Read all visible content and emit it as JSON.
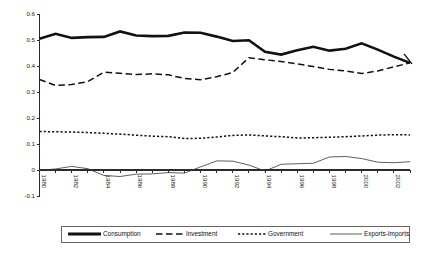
{
  "chart_data": {
    "type": "line",
    "title": "",
    "subtitle": "",
    "xlabel": "",
    "ylabel": "",
    "xlim": [
      1980,
      2003
    ],
    "ylim": [
      -0.1,
      0.6
    ],
    "grid": false,
    "legend_position": "bottom",
    "x": [
      1980,
      1981,
      1982,
      1983,
      1984,
      1985,
      1986,
      1987,
      1988,
      1989,
      1990,
      1991,
      1992,
      1993,
      1994,
      1995,
      1996,
      1997,
      1998,
      1999,
      2000,
      2001,
      2002,
      2003
    ],
    "x_tick_labels": [
      "1980",
      "1982",
      "1984",
      "1986",
      "1988",
      "1990",
      "1992",
      "1994",
      "1996",
      "1998",
      "2000",
      "2002"
    ],
    "x_ticks": [
      1980,
      1982,
      1984,
      1986,
      1988,
      1990,
      1992,
      1994,
      1996,
      1998,
      2000,
      2002
    ],
    "y_tick_labels": [
      "-0.1",
      "0",
      "0.1",
      "0.2",
      "0.3",
      "0.4",
      "0.5",
      "0.6"
    ],
    "y_ticks": [
      -0.1,
      0,
      0.1,
      0.2,
      0.3,
      0.4,
      0.5,
      0.6
    ],
    "series": [
      {
        "name": "Consumption",
        "line_style": "solid-thick",
        "values": [
          0.505,
          0.524,
          0.508,
          0.511,
          0.512,
          0.533,
          0.517,
          0.515,
          0.516,
          0.529,
          0.528,
          0.513,
          0.496,
          0.499,
          0.455,
          0.444,
          0.461,
          0.474,
          0.459,
          0.466,
          0.487,
          0.463,
          0.436,
          0.412
        ]
      },
      {
        "name": "Investment",
        "line_style": "dashed-long",
        "values": [
          0.348,
          0.325,
          0.329,
          0.34,
          0.376,
          0.372,
          0.367,
          0.37,
          0.366,
          0.352,
          0.347,
          0.359,
          0.375,
          0.432,
          0.424,
          0.417,
          0.408,
          0.398,
          0.387,
          0.381,
          0.371,
          0.381,
          0.397,
          0.412
        ]
      },
      {
        "name": "Government",
        "line_style": "dotted",
        "values": [
          0.148,
          0.147,
          0.146,
          0.144,
          0.141,
          0.138,
          0.134,
          0.13,
          0.128,
          0.121,
          0.122,
          0.127,
          0.133,
          0.135,
          0.131,
          0.128,
          0.123,
          0.124,
          0.126,
          0.128,
          0.131,
          0.134,
          0.136,
          0.135
        ]
      },
      {
        "name": "Exports-Imports",
        "line_style": "solid-thin",
        "values": [
          -0.001,
          0.004,
          0.014,
          0.005,
          -0.021,
          -0.025,
          -0.016,
          -0.015,
          -0.01,
          -0.012,
          0.012,
          0.035,
          0.034,
          0.019,
          -0.004,
          0.022,
          0.024,
          0.026,
          0.05,
          0.052,
          0.044,
          0.03,
          0.028,
          0.032
        ]
      }
    ],
    "legend": [
      {
        "label": "Consumption",
        "style": "solid-thick"
      },
      {
        "label": "Investment",
        "style": "dashed-long"
      },
      {
        "label": "Government",
        "style": "dotted"
      },
      {
        "label": "Exports-Imports",
        "style": "solid-thin"
      }
    ]
  }
}
